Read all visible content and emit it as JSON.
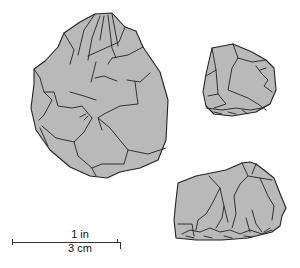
{
  "figure": {
    "fill_color": "#b9b9b9",
    "outline_color": "#222222",
    "items": [
      {
        "name": "large-handaxe",
        "view": "face"
      },
      {
        "name": "small-core",
        "view": "face"
      },
      {
        "name": "chopper-flake",
        "view": "side"
      }
    ]
  },
  "scale": {
    "imperial_label": "1 in",
    "metric_label": "3 cm"
  }
}
